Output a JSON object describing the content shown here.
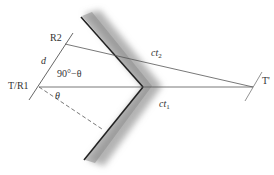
{
  "diagram": {
    "labels": {
      "r2": "R2",
      "t_r1": "T/R1",
      "t_prime": "T'",
      "d": "d",
      "angle_complement": "90°−θ",
      "theta": "θ",
      "ct2_c": "ct",
      "ct2_sub": "2",
      "ct1_c": "ct",
      "ct1_sub": "1"
    },
    "colors": {
      "line": "#555555",
      "wedge_edge": "#222222",
      "wedge_shade": "#888888"
    }
  }
}
